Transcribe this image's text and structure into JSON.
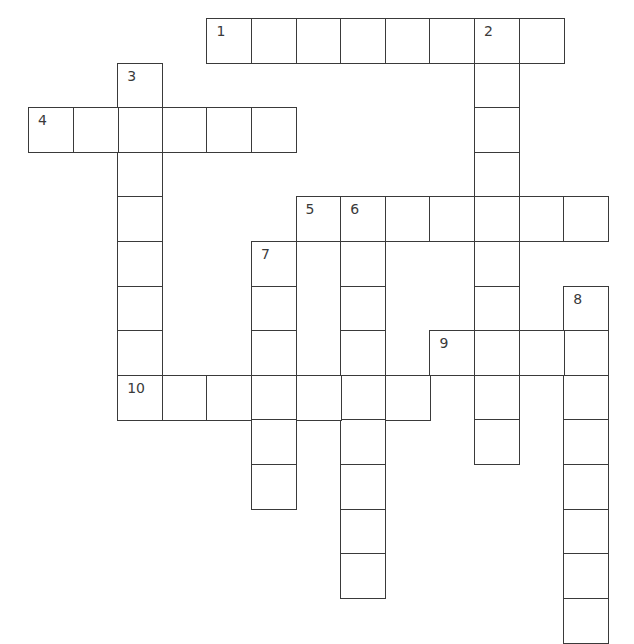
{
  "puzzle": {
    "type": "crossword",
    "cell_size_px": 44.6,
    "origin_px": [
      28,
      18
    ],
    "line_color": "#3a3a3a",
    "background": "#ffffff",
    "entries": [
      {
        "number": "1",
        "direction": "across",
        "row": 0,
        "col": 4,
        "length": 8
      },
      {
        "number": "2",
        "direction": "down",
        "row": 0,
        "col": 10,
        "length": 10
      },
      {
        "number": "3",
        "direction": "down",
        "row": 1,
        "col": 2,
        "length": 8
      },
      {
        "number": "4",
        "direction": "across",
        "row": 2,
        "col": 0,
        "length": 6
      },
      {
        "number": "5",
        "direction": "across",
        "row": 4,
        "col": 6,
        "length": 7
      },
      {
        "number": "6",
        "direction": "down",
        "row": 4,
        "col": 7,
        "length": 9
      },
      {
        "number": "7",
        "direction": "down",
        "row": 5,
        "col": 5,
        "length": 6
      },
      {
        "number": "8",
        "direction": "down",
        "row": 6,
        "col": 12,
        "length": 8
      },
      {
        "number": "9",
        "direction": "across",
        "row": 7,
        "col": 9,
        "length": 4
      },
      {
        "number": "10",
        "direction": "across",
        "row": 8,
        "col": 2,
        "length": 7
      }
    ]
  }
}
